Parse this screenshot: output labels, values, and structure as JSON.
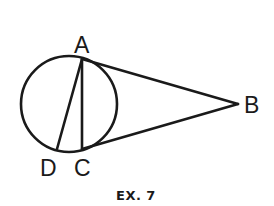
{
  "figure": {
    "caption": "EX. 7",
    "stroke_color": "#1a1a1a",
    "background": "#ffffff",
    "points": {
      "A": {
        "label": "A",
        "x": 82,
        "y": 59
      },
      "B": {
        "label": "B",
        "x": 238,
        "y": 104
      },
      "C": {
        "label": "C",
        "x": 82,
        "y": 149
      },
      "D": {
        "label": "D",
        "x": 57,
        "y": 149
      }
    },
    "circle": {
      "cx": 69,
      "cy": 104,
      "r": 48
    },
    "segments": [
      "AB",
      "CB",
      "AC",
      "AD"
    ]
  }
}
